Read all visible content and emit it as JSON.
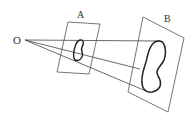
{
  "diagram": {
    "type": "central-projection",
    "point_label": "O",
    "planes": [
      {
        "label": "A",
        "role": "near-plane"
      },
      {
        "label": "B",
        "role": "far-plane"
      }
    ],
    "colors": {
      "stroke": "#444444",
      "shape_stroke": "#222222",
      "background": "#ffffff"
    }
  }
}
